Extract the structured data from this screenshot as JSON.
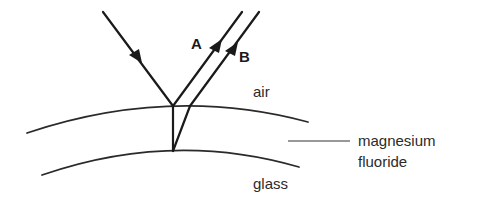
{
  "diagram": {
    "rays": {
      "incident": {
        "label": ""
      },
      "reflected_top": {
        "label": "A"
      },
      "reflected_bottom": {
        "label": "B"
      }
    },
    "regions": {
      "air": "air",
      "coating_line1": "magnesium",
      "coating_line2": "fluoride",
      "substrate": "glass"
    },
    "colors": {
      "ink": "#1a1a1a",
      "background": "#ffffff"
    }
  }
}
